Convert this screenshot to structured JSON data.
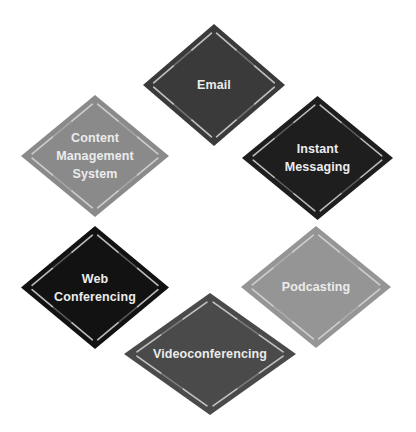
{
  "diagram": {
    "title": "",
    "nodes": [
      {
        "id": "email",
        "lines": [
          "Email"
        ],
        "fill": "#3a3a3a",
        "x": 143,
        "y": 24,
        "w": 142,
        "h": 122
      },
      {
        "id": "instant-messaging",
        "lines": [
          "Instant",
          "Messaging"
        ],
        "fill": "#1e1e1e",
        "x": 242,
        "y": 96,
        "w": 151,
        "h": 124
      },
      {
        "id": "podcasting",
        "lines": [
          "Podcasting"
        ],
        "fill": "#959595",
        "x": 241,
        "y": 226,
        "w": 150,
        "h": 122
      },
      {
        "id": "videoconferencing",
        "lines": [
          "Videoconferencing"
        ],
        "fill": "#4a4a4a",
        "x": 124,
        "y": 293,
        "w": 172,
        "h": 122
      },
      {
        "id": "web-conferencing",
        "lines": [
          "Web",
          "Conferencing"
        ],
        "fill": "#121212",
        "x": 21,
        "y": 226,
        "w": 148,
        "h": 123
      },
      {
        "id": "content-management-system",
        "lines": [
          "Content",
          "Management",
          "System"
        ],
        "fill": "#8a8a8a",
        "x": 21,
        "y": 95,
        "w": 148,
        "h": 122
      }
    ],
    "highlight_color": "#d8d8d8",
    "text_color": "#ececec",
    "background": "#ffffff"
  }
}
